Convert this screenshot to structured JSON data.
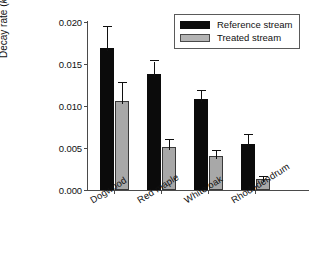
{
  "chart_data": {
    "type": "bar",
    "title": "",
    "xlabel": "",
    "ylabel": "Decay rate (k)",
    "ylabel_plain": "Decay rate (",
    "ylabel_italic": "k",
    "ylabel_close": ")",
    "categories": [
      "Dogwood",
      "Red maple",
      "White oak",
      "Rhododendrum"
    ],
    "ylim": [
      0.0,
      0.02
    ],
    "ytick_labels": [
      "0.000",
      "0.005",
      "0.010",
      "0.015",
      "0.020"
    ],
    "ytick_values": [
      0.0,
      0.005,
      0.01,
      0.015,
      0.02
    ],
    "grid": false,
    "legend_position": "top-right",
    "series": [
      {
        "name": "Reference stream",
        "color": "#0b0b0b",
        "values": [
          0.0169,
          0.0138,
          0.0108,
          0.0055
        ],
        "errors": [
          0.0025,
          0.0015,
          0.001,
          0.0011
        ]
      },
      {
        "name": "Treated stream",
        "color": "#a8a8a8",
        "values": [
          0.0106,
          0.0051,
          0.004,
          0.0013
        ],
        "errors": [
          0.0021,
          0.0009,
          0.0007,
          0.0002
        ]
      }
    ]
  },
  "legend": {
    "items": [
      {
        "label": "Reference stream",
        "swatch": "ref"
      },
      {
        "label": "Treated stream",
        "swatch": "trt"
      }
    ]
  },
  "colors": {
    "reference": "#0b0b0b",
    "treated": "#a8a8a8",
    "axis": "#4a4a4a",
    "text": "#111111",
    "background": "#ffffff"
  }
}
